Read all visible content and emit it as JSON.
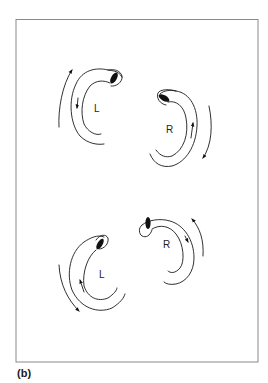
{
  "figure": {
    "caption": "(b)",
    "panels": [
      {
        "id": "top-left",
        "side_label": "L",
        "rotation": "counter-clockwise"
      },
      {
        "id": "top-right",
        "side_label": "R",
        "rotation": "clockwise"
      },
      {
        "id": "bottom-left",
        "side_label": "L",
        "rotation": "clockwise"
      },
      {
        "id": "bottom-right",
        "side_label": "R",
        "rotation": "counter-clockwise"
      }
    ]
  },
  "colors": {
    "line": "#1a1a1a",
    "frame": "#8a8a8a",
    "background": "#ffffff"
  }
}
